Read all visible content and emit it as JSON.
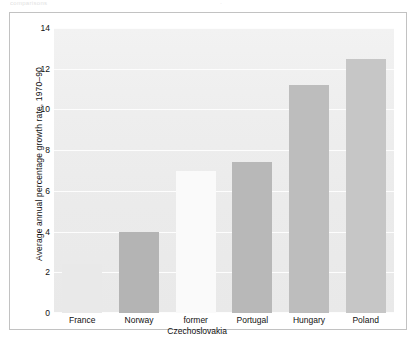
{
  "top_caption": {
    "left_fragment": "comparisons",
    "right_fragment": "·"
  },
  "chart_data": {
    "type": "bar",
    "title": "",
    "subtitle": "",
    "xlabel": "",
    "ylabel": "Average annual percentage growth rate, 1970–90",
    "categories": [
      "France",
      "Norway",
      "former Czechoslovakia",
      "Portugal",
      "Hungary",
      "Poland"
    ],
    "category_lines": [
      [
        "France"
      ],
      [
        "Norway"
      ],
      [
        "former",
        "Czechoslovakia"
      ],
      [
        "Portugal"
      ],
      [
        "Hungary"
      ],
      [
        "Poland"
      ]
    ],
    "values": [
      2.4,
      4.0,
      7.0,
      7.4,
      11.2,
      12.5
    ],
    "bar_colors": [
      "#e9e9e9",
      "#b4b4b4",
      "#fafafa",
      "#b8b8b8",
      "#bdbdbd",
      "#c6c6c6"
    ],
    "ylim": [
      0,
      14
    ],
    "yticks": [
      0,
      2,
      4,
      6,
      8,
      10,
      12,
      14
    ],
    "ytick_labels": [
      "0",
      "2",
      "4",
      "6",
      "8",
      "10",
      "12",
      "14"
    ],
    "grid": true,
    "grid_color": "#fdfdfd",
    "plot_background": "#eeeeee",
    "legend": null,
    "legend_position": "none"
  }
}
